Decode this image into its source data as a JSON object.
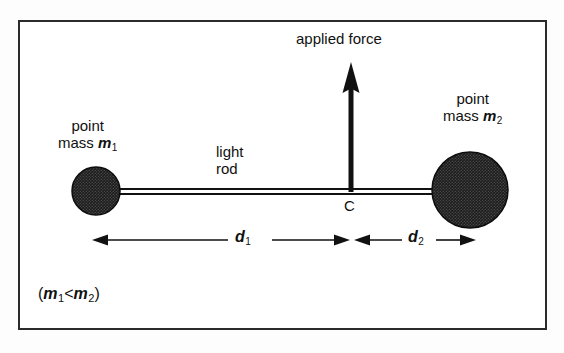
{
  "figure": {
    "kind": "physics-free-body-diagram",
    "background_color": "#ffffff",
    "frame_color": "#2b2b2b",
    "ink_color": "#111111"
  },
  "labels": {
    "applied_force": "applied force",
    "point_text": "point",
    "mass_word": "mass",
    "mass1_symbol": "m",
    "mass1_subscript": "1",
    "mass2_symbol": "m",
    "mass2_subscript": "2",
    "light": "light",
    "rod": "rod",
    "centre_point": "C",
    "d1_symbol": "d",
    "d1_subscript": "1",
    "d2_symbol": "d",
    "d2_subscript": "2",
    "relation_open": "(",
    "relation_m1": "m",
    "relation_m1_sub": "1",
    "relation_operator": "<",
    "relation_m2": "m",
    "relation_m2_sub": "2",
    "relation_close": ")"
  },
  "geometry": {
    "frame": {
      "x": 18,
      "y": 20,
      "width": 529,
      "height": 310
    },
    "rod": {
      "x1": 96,
      "x2": 470,
      "y": 191,
      "gap": 4
    },
    "mass1_circle": {
      "cx": 96,
      "cy": 191,
      "r": 24
    },
    "mass2_circle": {
      "cx": 470,
      "cy": 190,
      "r": 38
    },
    "force_arrow": {
      "x": 351,
      "y_base": 191,
      "y_tip": 66
    },
    "pivot_c": {
      "x": 351,
      "y": 191
    },
    "dimension_line_y": 240,
    "d1_extent": {
      "from": 96,
      "to": 351
    },
    "d2_extent": {
      "from": 351,
      "to": 470
    }
  },
  "icon_names": {
    "force_vector": "up-arrow-icon",
    "dimension_d1": "left-right-dimension-arrow-icon",
    "dimension_d2": "left-right-dimension-arrow-icon",
    "mass1": "filled-circle-icon",
    "mass2": "filled-circle-icon"
  }
}
